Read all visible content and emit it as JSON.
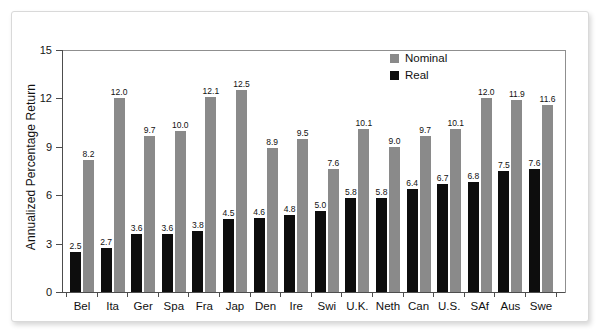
{
  "chart_data": {
    "type": "bar",
    "title": "",
    "xlabel": "",
    "ylabel": "Annualized Percentage Return",
    "ylim": [
      0,
      15
    ],
    "yticks": [
      0,
      3,
      6,
      9,
      12,
      15
    ],
    "grid": false,
    "legend_position": "top-right",
    "categories": [
      "Bel",
      "Ita",
      "Ger",
      "Spa",
      "Fra",
      "Jap",
      "Den",
      "Ire",
      "Swi",
      "U.K.",
      "Neth",
      "Can",
      "U.S.",
      "SAf",
      "Aus",
      "Swe"
    ],
    "series": [
      {
        "name": "Real",
        "color": "#0d0d0d",
        "values": [
          2.5,
          2.7,
          3.6,
          3.6,
          3.8,
          4.5,
          4.6,
          4.8,
          5.0,
          5.8,
          5.8,
          6.4,
          6.7,
          6.8,
          7.5,
          7.6
        ],
        "labels": [
          "2.5",
          "2.7",
          "3.6",
          "3.6",
          "3.8",
          "4.5",
          "4.6",
          "4.8",
          "5.0",
          "5.8",
          "5.8",
          "6.4",
          "6.7",
          "6.8",
          "7.5",
          "7.6"
        ]
      },
      {
        "name": "Nominal",
        "color": "#8a8a8a",
        "values": [
          8.2,
          12.0,
          9.7,
          10.0,
          12.1,
          12.5,
          8.9,
          9.5,
          7.6,
          10.1,
          9.0,
          9.7,
          10.1,
          12.0,
          11.9,
          11.6
        ],
        "labels": [
          "8.2",
          "12.0",
          "9.7",
          "10.0",
          "12.1",
          "12.5",
          "8.9",
          "9.5",
          "7.6",
          "10.1",
          "9.0",
          "9.7",
          "10.1",
          "12.0",
          "11.9",
          "11.6"
        ]
      }
    ]
  },
  "legend": {
    "items": [
      {
        "label": "Nominal",
        "color": "#8a8a8a"
      },
      {
        "label": "Real",
        "color": "#0d0d0d"
      }
    ]
  },
  "axis": {
    "y_title": "Annualized Percentage Return",
    "y_tick_labels": [
      "15",
      "12",
      "9",
      "6",
      "3",
      "0"
    ]
  }
}
